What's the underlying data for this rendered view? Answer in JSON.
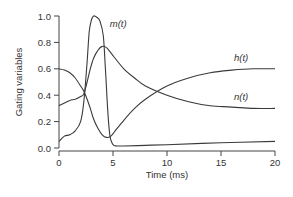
{
  "chart_data": {
    "type": "line",
    "title": "",
    "xlabel": "Time (ms)",
    "ylabel": "Gating variables",
    "xlim": [
      0,
      20
    ],
    "ylim": [
      0,
      1.0
    ],
    "x_ticks": [
      "0",
      "5",
      "10",
      "15",
      "20"
    ],
    "y_ticks": [
      "0.0",
      "0.2",
      "0.4",
      "0.6",
      "0.8",
      "1.0"
    ],
    "grid": false,
    "legend": "inline labels",
    "series": [
      {
        "name": "m(t)",
        "x": [
          0,
          0.5,
          1,
          1.5,
          2,
          2.3,
          2.6,
          2.8,
          3.0,
          3.2,
          3.5,
          3.8,
          4.1,
          4.3,
          4.5,
          4.7,
          4.9,
          5.1,
          5.5,
          6,
          8,
          10,
          15,
          20
        ],
        "values": [
          0.05,
          0.09,
          0.1,
          0.13,
          0.2,
          0.35,
          0.65,
          0.88,
          0.97,
          1.0,
          0.99,
          0.96,
          0.85,
          0.6,
          0.3,
          0.1,
          0.04,
          0.02,
          0.015,
          0.015,
          0.02,
          0.025,
          0.04,
          0.05
        ]
      },
      {
        "name": "h(t)",
        "x": [
          0,
          0.5,
          1,
          1.5,
          2,
          2.3,
          2.6,
          2.9,
          3.2,
          3.6,
          4.0,
          4.4,
          4.8,
          5.2,
          6,
          7,
          8,
          10,
          12,
          14,
          16,
          18,
          20
        ],
        "values": [
          0.6,
          0.59,
          0.57,
          0.53,
          0.47,
          0.43,
          0.37,
          0.3,
          0.22,
          0.15,
          0.1,
          0.08,
          0.09,
          0.13,
          0.21,
          0.3,
          0.37,
          0.47,
          0.53,
          0.57,
          0.59,
          0.6,
          0.6
        ]
      },
      {
        "name": "n(t)",
        "x": [
          0,
          0.5,
          1,
          1.5,
          2,
          2.3,
          2.6,
          2.9,
          3.2,
          3.6,
          4.0,
          4.4,
          5,
          6,
          7,
          8,
          10,
          12,
          14,
          16,
          18,
          20
        ],
        "values": [
          0.32,
          0.34,
          0.36,
          0.37,
          0.39,
          0.41,
          0.5,
          0.6,
          0.68,
          0.74,
          0.77,
          0.76,
          0.7,
          0.6,
          0.53,
          0.47,
          0.4,
          0.35,
          0.32,
          0.31,
          0.3,
          0.3
        ]
      }
    ],
    "annotations": [
      {
        "text": "m(t)",
        "x": 4.7,
        "y": 0.92
      },
      {
        "text": "h(t)",
        "x": 16.2,
        "y": 0.66
      },
      {
        "text": "n(t)",
        "x": 16.2,
        "y": 0.36
      }
    ]
  }
}
